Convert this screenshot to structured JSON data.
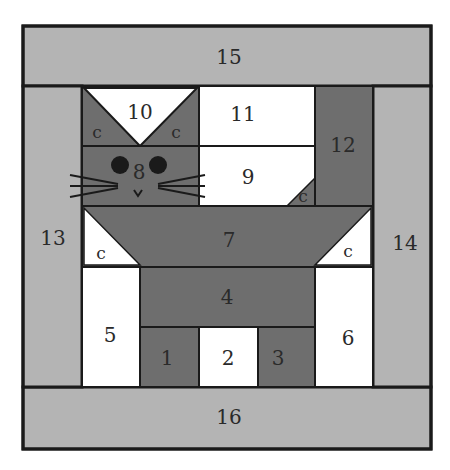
{
  "diagram": {
    "colors": {
      "light_gray": "#b4b4b4",
      "dark_gray": "#6e6e6e",
      "white": "#ffffff",
      "outline": "#1a1a1a",
      "eyes": "#1a1a1a"
    },
    "pieces": {
      "p1": "1",
      "p2": "2",
      "p3": "3",
      "p4": "4",
      "p5": "5",
      "p6": "6",
      "p7": "7",
      "p8": "8",
      "p9": "9",
      "p10": "10",
      "p11": "11",
      "p12": "12",
      "p13": "13",
      "p14": "14",
      "p15": "15",
      "p16": "16"
    },
    "corner_label": "c"
  }
}
